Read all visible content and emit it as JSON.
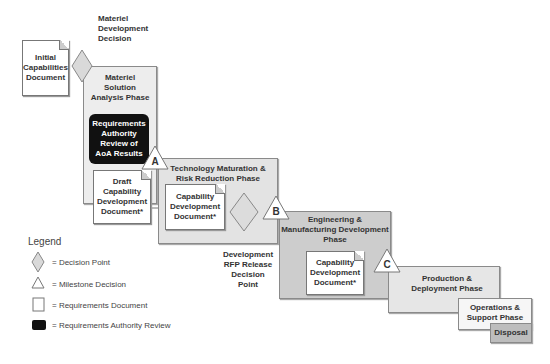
{
  "diagram": {
    "decision_labels": {
      "mdd": [
        "Materiel",
        "Development",
        "Decision"
      ],
      "rfp": [
        "Development",
        "RFP Release",
        "Decision",
        "Point"
      ]
    },
    "documents": {
      "icd": [
        "Initial",
        "Capabilities",
        "Document"
      ],
      "draft_cdd": [
        "Draft",
        "Capability",
        "Development",
        "Document*"
      ],
      "cdd_tmrr": [
        "Capability",
        "Development",
        "Document*"
      ],
      "cdd_emd": [
        "Capability",
        "Development",
        "Document*"
      ]
    },
    "review": [
      "Requirements",
      "Authority",
      "Review of",
      "AoA Results"
    ],
    "phases": {
      "msa": [
        "Materiel",
        "Solution",
        "Analysis Phase"
      ],
      "tmrr": [
        "Technology Maturation &",
        "Risk Reduction Phase"
      ],
      "emd": [
        "Engineering &",
        "Manufacturing Development",
        "Phase"
      ],
      "pd": [
        "Production &",
        "Deployment Phase"
      ],
      "os": [
        "Operations &",
        "Support Phase"
      ],
      "disposal": "Disposal"
    },
    "milestones": {
      "a": "A",
      "b": "B",
      "c": "C"
    }
  },
  "legend": {
    "title": "Legend",
    "items": [
      {
        "icon": "diamond",
        "label": "= Decision Point"
      },
      {
        "icon": "triangle",
        "label": "= Milestone Decision"
      },
      {
        "icon": "document",
        "label": "= Requirements Document"
      },
      {
        "icon": "black-box",
        "label": "= Requirements Authority Review"
      }
    ]
  },
  "colors": {
    "phase_light": "#ececec",
    "phase_mid": "#dedede",
    "phase_dark": "#c8c8c8",
    "review": "#111111",
    "diamond": "#d9d9d9"
  }
}
